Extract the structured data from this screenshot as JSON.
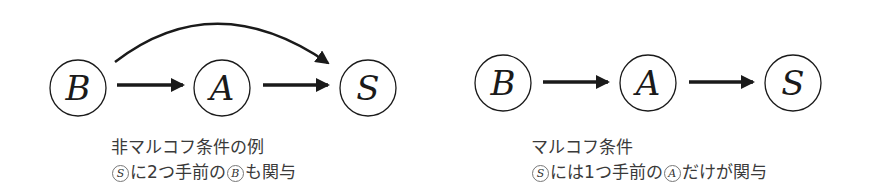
{
  "left_diagram": {
    "nodes": [
      {
        "id": "B",
        "label": "B",
        "cx": 78,
        "cy": 88
      },
      {
        "id": "A",
        "label": "A",
        "cx": 222,
        "cy": 88
      },
      {
        "id": "S",
        "label": "S",
        "cx": 368,
        "cy": 88
      }
    ],
    "edges": [
      {
        "from": "B",
        "to": "A",
        "type": "straight"
      },
      {
        "from": "A",
        "to": "S",
        "type": "straight"
      },
      {
        "from": "B",
        "to": "S",
        "type": "curved"
      }
    ],
    "caption": {
      "title": "非マルコフ条件の例",
      "line2_circled_1": "S",
      "line2_text_1": "に2つ手前の",
      "line2_circled_2": "B",
      "line2_text_2": "も関与"
    }
  },
  "right_diagram": {
    "nodes": [
      {
        "id": "B",
        "label": "B",
        "cx": 503,
        "cy": 83
      },
      {
        "id": "A",
        "label": "A",
        "cx": 648,
        "cy": 83
      },
      {
        "id": "S",
        "label": "S",
        "cx": 793,
        "cy": 83
      }
    ],
    "edges": [
      {
        "from": "B",
        "to": "A",
        "type": "straight"
      },
      {
        "from": "A",
        "to": "S",
        "type": "straight"
      }
    ],
    "caption": {
      "title": "マルコフ条件",
      "line2_circled_1": "S",
      "line2_text_1": "には1つ手前の",
      "line2_circled_2": "A",
      "line2_text_2": "だけが関与"
    }
  },
  "colors": {
    "stroke": "#1a1a1a",
    "caption_text": "#3a3a3a",
    "background": "#ffffff"
  }
}
